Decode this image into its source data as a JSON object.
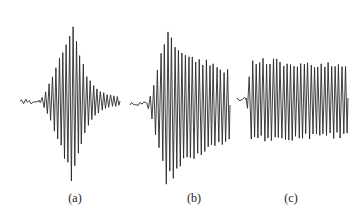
{
  "figure": {
    "panels": [
      {
        "id": "a",
        "label": "(a)",
        "description": "Waveform with quiet onset, rapidly building large-amplitude burst peaking early, then decaying to near-zero tail",
        "envelope": "build-up then decay",
        "x_start": 20,
        "x_end": 120,
        "baseline_y": 101,
        "max_up": 85,
        "max_down": 87,
        "label_x": 75,
        "label_y": 191,
        "cycles": 24,
        "pre_noise": 18,
        "peak_pos": 0.42,
        "decay": 2.6,
        "tail": 0.04,
        "color": "#2a2a2a"
      },
      {
        "id": "b",
        "label": "(b)",
        "description": "Waveform with brief low-amplitude onset, abrupt large burst, then slow decay maintaining substantial amplitude",
        "envelope": "sudden onset, slow decay",
        "x_start": 130,
        "x_end": 230,
        "baseline_y": 105,
        "max_up": 78,
        "max_down": 83,
        "label_x": 194,
        "label_y": 191,
        "cycles": 24,
        "pre_noise": 16,
        "peak_pos": 0.22,
        "decay": 1.0,
        "tail": 0.35,
        "color": "#2a2a2a"
      },
      {
        "id": "c",
        "label": "(c)",
        "description": "Waveform with tiny onset then sustained, roughly constant-amplitude irregular oscillation",
        "envelope": "sustained",
        "x_start": 237,
        "x_end": 348,
        "baseline_y": 98,
        "max_up": 41,
        "max_down": 46,
        "label_x": 291,
        "label_y": 191,
        "cycles": 30,
        "pre_noise": 8,
        "peak_pos": 0.05,
        "decay": 0.35,
        "tail": 0.7,
        "color": "#2a2a2a"
      }
    ]
  }
}
